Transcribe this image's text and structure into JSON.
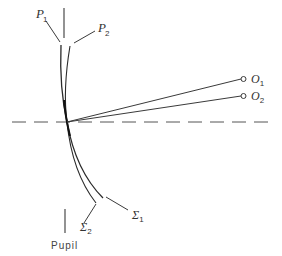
{
  "diagram": {
    "title": "",
    "colors": {
      "line": "#3a3a3a",
      "axis": "#555555",
      "background": "#ffffff"
    },
    "labels": {
      "p1": {
        "main": "P",
        "sub": "1"
      },
      "p2": {
        "main": "P",
        "sub": "2"
      },
      "o1": {
        "main": "O",
        "sub": "1"
      },
      "o2": {
        "main": "O",
        "sub": "2"
      },
      "sigma1": {
        "main": "Σ",
        "sub": "1"
      },
      "sigma2": {
        "main": "Σ",
        "sub": "2"
      },
      "pupil": "Pupil"
    },
    "elements": {
      "optical_axis": "dashed horizontal line",
      "surfaces": [
        "P1 curve",
        "P2 curve"
      ],
      "rays": [
        "ray to O1",
        "ray to O2"
      ],
      "object_points": [
        "O1",
        "O2"
      ],
      "pupil_marker": "vertical line"
    }
  }
}
